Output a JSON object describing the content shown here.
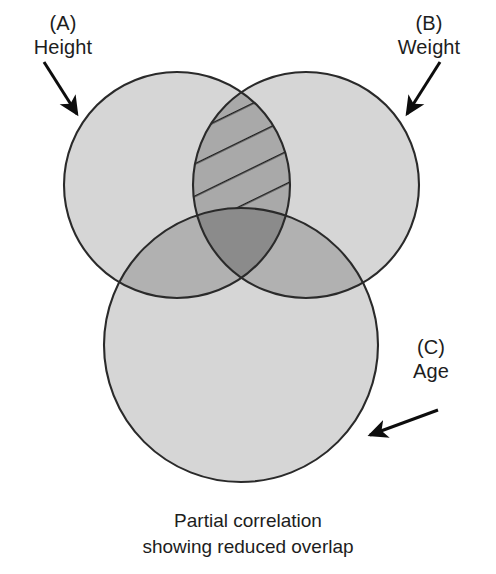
{
  "figure": {
    "type": "venn-diagram",
    "set_count": 3,
    "caption_line1": "Partial correlation",
    "caption_line2": "showing reduced overlap",
    "background_color": "#ffffff",
    "outline_color": "#2a2a2a",
    "hatch_color": "#1f1f1f"
  },
  "sets": {
    "a": {
      "tag": "(A)",
      "name": "Height",
      "fill": "#d6d6d6",
      "cx": 177,
      "cy": 185,
      "r": 113
    },
    "b": {
      "tag": "(B)",
      "name": "Weight",
      "fill": "#d6d6d6",
      "cx": 306,
      "cy": 185,
      "r": 113
    },
    "c": {
      "tag": "(C)",
      "name": "Age",
      "fill": "#d6d6d6",
      "cx": 241,
      "cy": 345,
      "r": 137
    }
  },
  "regions": {
    "ab_hatched": {
      "label": "A and B overlap, hatched",
      "fill": "#a9a9a9",
      "hatched": true,
      "hatch_angle_deg": 26,
      "hatch_spacing": 29
    },
    "ac": {
      "label": "A and C overlap",
      "fill": "#b1b1b1",
      "hatched": false
    },
    "bc": {
      "label": "B and C overlap",
      "fill": "#b1b1b1",
      "hatched": false
    },
    "abc": {
      "label": "A and B and C overlap",
      "fill": "#8b8b8b",
      "hatched": false
    }
  },
  "annotations": {
    "arrow_a": {
      "name": "arrow pointing to Height circle",
      "x1": 44,
      "y1": 62,
      "x2": 77,
      "y2": 114
    },
    "arrow_b": {
      "name": "arrow pointing to Weight circle",
      "x1": 440,
      "y1": 62,
      "x2": 407,
      "y2": 114
    },
    "arrow_c": {
      "name": "arrow pointing to Age circle",
      "x1": 438,
      "y1": 410,
      "x2": 370,
      "y2": 435
    }
  }
}
